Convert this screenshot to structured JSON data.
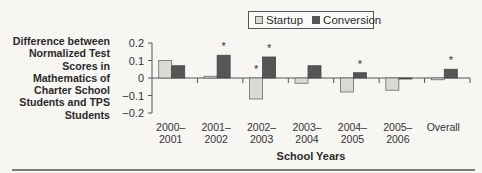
{
  "legend": {
    "items": [
      {
        "label": "Startup",
        "color": "#d9d9d6"
      },
      {
        "label": "Conversion",
        "color": "#565656"
      }
    ]
  },
  "axes": {
    "ylabel": "Difference between Normalized Test Scores in Mathematics of Charter School Students and TPS Students",
    "xlabel": "School Years",
    "yticks": [
      "0.2",
      "0.1",
      "0",
      "−0.1",
      "−0.2"
    ]
  },
  "chart_data": {
    "type": "bar",
    "title": "",
    "xlabel": "School Years",
    "ylabel": "Difference between Normalized Test Scores in Mathematics of Charter School Students and TPS Students",
    "ylim": [
      -0.2,
      0.2
    ],
    "yticks": [
      0.2,
      0.1,
      0,
      -0.1,
      -0.2
    ],
    "grid": false,
    "legend_position": "top",
    "categories": [
      "2000–2001",
      "2001–2002",
      "2002–2003",
      "2003–2004",
      "2004–2005",
      "2005–2006",
      "Overall"
    ],
    "category_lines": [
      [
        "2000–",
        "2001"
      ],
      [
        "2001–",
        "2002"
      ],
      [
        "2002–",
        "2003"
      ],
      [
        "2003–",
        "2004"
      ],
      [
        "2004–",
        "2005"
      ],
      [
        "2005–",
        "2006"
      ],
      [
        "Overall",
        ""
      ]
    ],
    "series": [
      {
        "name": "Startup",
        "color": "#d9d9d6",
        "values": [
          0.1,
          0.01,
          -0.12,
          -0.03,
          -0.08,
          -0.07,
          -0.01
        ],
        "significant": [
          false,
          false,
          true,
          false,
          false,
          false,
          false
        ]
      },
      {
        "name": "Conversion",
        "color": "#565656",
        "values": [
          0.07,
          0.13,
          0.12,
          0.07,
          0.03,
          -0.005,
          0.05
        ],
        "significant": [
          false,
          true,
          true,
          false,
          true,
          false,
          true
        ]
      }
    ],
    "annotations": [
      "* marks statistically significant differences"
    ],
    "significance_marker": "*"
  }
}
